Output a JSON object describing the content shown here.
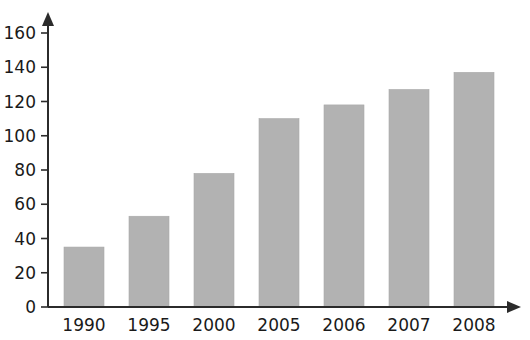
{
  "chart_data": {
    "type": "bar",
    "title": "",
    "subtitle": "",
    "xlabel": "",
    "ylabel": "",
    "categories": [
      "1990",
      "1995",
      "2000",
      "2005",
      "2006",
      "2007",
      "2008"
    ],
    "values": [
      35,
      53,
      78,
      110,
      118,
      127,
      137
    ],
    "series": [
      {
        "name": "",
        "values": [
          35,
          53,
          78,
          110,
          118,
          127,
          137
        ]
      }
    ],
    "ylim": [
      0,
      160
    ],
    "ytick_values": [
      0,
      20,
      40,
      60,
      80,
      100,
      120,
      140,
      160
    ],
    "ytick_labels": [
      "0",
      "20",
      "40",
      "60",
      "80",
      "100",
      "120",
      "140",
      "160"
    ],
    "xtick_labels": [
      "1990",
      "1995",
      "2000",
      "2005",
      "2006",
      "2007",
      "2008"
    ],
    "grid": false,
    "legend": false,
    "legend_position": "none",
    "annotations": [],
    "colors": {
      "bar_fill": "#b2b2b2",
      "bar_stroke": "#a8a8a8",
      "axis": "#2b2b2b",
      "text": "#1a1a1a",
      "background": "#ffffff"
    },
    "axis_style": {
      "y_axis_arrow": true,
      "x_axis_arrow": true,
      "tick_side": "outside"
    }
  }
}
